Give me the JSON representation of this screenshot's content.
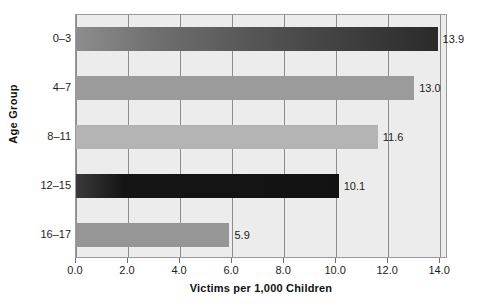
{
  "chart_data": {
    "type": "bar",
    "orientation": "horizontal",
    "title": "",
    "categories": [
      "0–3",
      "4–7",
      "8–11",
      "12–15",
      "16–17"
    ],
    "values": [
      13.9,
      13.0,
      11.6,
      10.1,
      5.9
    ],
    "value_labels": [
      "13.9",
      "13.0",
      "11.6",
      "10.1",
      "5.9"
    ],
    "xlabel": "Victims per 1,000 Children",
    "ylabel": "Age Group",
    "xlim": [
      0.0,
      14.3
    ],
    "xticks": [
      0.0,
      2.0,
      4.0,
      6.0,
      8.0,
      10.0,
      12.0,
      14.0
    ],
    "xtick_labels": [
      "0.0",
      "2.0",
      "4.0",
      "6.0",
      "8.0",
      "10.0",
      "12.0",
      "14.0"
    ],
    "grid": true,
    "grid_axis": "x",
    "legend": null,
    "bar_colors": [
      "#4a4a4a",
      "#9b9b9b",
      "#b4b4b4",
      "#151515",
      "#969696"
    ],
    "plot_background": "#ececec",
    "gridline_color": "#8d8d8d",
    "frame_color": "#9a9a9a",
    "text_color": "#1d1d1d"
  },
  "axis": {
    "y_title": "Age Group",
    "x_title": "Victims per 1,000 Children"
  }
}
